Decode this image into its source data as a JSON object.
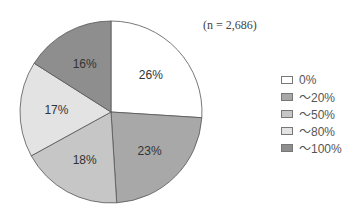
{
  "chart_data": {
    "type": "pie",
    "title": "",
    "note": "(n = 2,686)",
    "categories": [
      "0%",
      "~20%",
      "~50%",
      "~80%",
      "~100%"
    ],
    "values": [
      26,
      23,
      18,
      17,
      16
    ],
    "labels": [
      "26%",
      "23%",
      "18%",
      "17%",
      "16%"
    ],
    "colors": [
      "#ffffff",
      "#a8a8a8",
      "#c6c6c6",
      "#e3e3e3",
      "#8e8e8e"
    ],
    "start_angle": "12 o'clock",
    "direction": "clockwise",
    "legend_position": "right"
  },
  "legend": {
    "items": [
      {
        "label": "0%",
        "color": "#ffffff"
      },
      {
        "label": "～20%",
        "color": "#a8a8a8"
      },
      {
        "label": "～50%",
        "color": "#c6c6c6"
      },
      {
        "label": "～80%",
        "color": "#e3e3e3"
      },
      {
        "label": "～100%",
        "color": "#8e8e8e"
      }
    ]
  }
}
